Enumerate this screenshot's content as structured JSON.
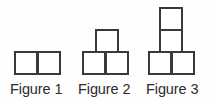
{
  "diagram": {
    "type": "growing-pattern-of-unit-squares",
    "background_color": "#fefefe",
    "square_fill_color": "#ffffff",
    "square_border_color": "#3a3a3a",
    "label_color": "#2b2b2b",
    "square_size_px": 24,
    "figures": [
      {
        "id": "figure-1",
        "label": "Figure 1",
        "square_count": 2,
        "description": "one horizontal row of two squares",
        "squares": [
          {
            "name": "figure-1-square-bottom-left",
            "x": 14,
            "y": 51,
            "w": 24,
            "h": 24
          },
          {
            "name": "figure-1-square-bottom-right",
            "x": 37,
            "y": 51,
            "w": 24,
            "h": 24
          }
        ]
      },
      {
        "id": "figure-2",
        "label": "Figure 2",
        "square_count": 3,
        "description": "row of two squares with one square stacked on top",
        "squares": [
          {
            "name": "figure-2-square-bottom-left",
            "x": 82,
            "y": 51,
            "w": 24,
            "h": 24
          },
          {
            "name": "figure-2-square-bottom-right",
            "x": 105,
            "y": 51,
            "w": 24,
            "h": 24
          },
          {
            "name": "figure-2-square-top",
            "x": 95,
            "y": 29,
            "w": 24,
            "h": 24
          }
        ]
      },
      {
        "id": "figure-3",
        "label": "Figure 3",
        "square_count": 4,
        "description": "row of two squares with a column of two squares stacked on top",
        "squares": [
          {
            "name": "figure-3-square-bottom-left",
            "x": 148,
            "y": 51,
            "w": 24,
            "h": 24
          },
          {
            "name": "figure-3-square-bottom-right",
            "x": 171,
            "y": 51,
            "w": 24,
            "h": 24
          },
          {
            "name": "figure-3-square-middle",
            "x": 159,
            "y": 29,
            "w": 24,
            "h": 24
          },
          {
            "name": "figure-3-square-top",
            "x": 159,
            "y": 7,
            "w": 24,
            "h": 24
          }
        ]
      }
    ],
    "labels": {
      "figure_1": "Figure 1",
      "figure_2": "Figure 2",
      "figure_3": "Figure 3"
    }
  }
}
